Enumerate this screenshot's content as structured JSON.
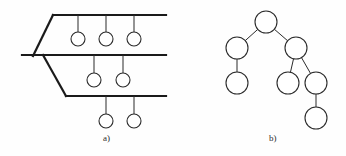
{
  "figure": {
    "width": 346,
    "height": 156,
    "background_color": "#fefefe",
    "stroke_color": "#2b2b2b",
    "thick_stroke_color": "#1a1a1a",
    "node_fill": "#ffffff",
    "panels": [
      {
        "id": "a",
        "caption": "a)",
        "caption_x": 103,
        "caption_y": 133
      },
      {
        "id": "b",
        "caption": "b)",
        "caption_x": 269,
        "caption_y": 133
      }
    ]
  },
  "panel_a": {
    "caption": "a)",
    "description": "layered horizontal bars with pendant circles",
    "bar_stroke_width": 2.2,
    "link_stroke_width": 1,
    "node_radius": 7,
    "bars": [
      {
        "name": "top-bar",
        "x1": 53,
        "y1": 15,
        "x2": 166,
        "y2": 15
      },
      {
        "name": "middle-bar",
        "x1": 22,
        "y1": 55,
        "x2": 166,
        "y2": 55
      },
      {
        "name": "bottom-bar",
        "x1": 66,
        "y1": 96,
        "x2": 166,
        "y2": 96
      }
    ],
    "diagonals": [
      {
        "name": "top-left-diagonal",
        "x1": 53,
        "y1": 15,
        "x2": 33,
        "y2": 56
      },
      {
        "name": "middle-left-diagonal",
        "x1": 43,
        "y1": 55,
        "x2": 66,
        "y2": 96
      }
    ],
    "nodes": [
      {
        "name": "node-a1",
        "cx": 78,
        "cy": 39,
        "parent_y": 15
      },
      {
        "name": "node-a2",
        "cx": 106,
        "cy": 39,
        "parent_y": 15
      },
      {
        "name": "node-a3",
        "cx": 134,
        "cy": 39,
        "parent_y": 15
      },
      {
        "name": "node-a4",
        "cx": 94,
        "cy": 80,
        "parent_y": 55
      },
      {
        "name": "node-a5",
        "cx": 123,
        "cy": 80,
        "parent_y": 55
      },
      {
        "name": "node-a6",
        "cx": 106,
        "cy": 121,
        "parent_y": 96
      },
      {
        "name": "node-a7",
        "cx": 134,
        "cy": 121,
        "parent_y": 96
      }
    ]
  },
  "panel_b": {
    "caption": "b)",
    "description": "binary tree of circular nodes",
    "link_stroke_width": 1,
    "node_stroke_width": 1.1,
    "node_radius": 11,
    "nodes": [
      {
        "name": "tree-node-root",
        "id": "n0",
        "cx": 266,
        "cy": 22
      },
      {
        "name": "tree-node-left",
        "id": "n1",
        "cx": 237,
        "cy": 48
      },
      {
        "name": "tree-node-right",
        "id": "n2",
        "cx": 296,
        "cy": 48
      },
      {
        "name": "tree-node-left-child",
        "id": "n3",
        "cx": 237,
        "cy": 83
      },
      {
        "name": "tree-node-right-left",
        "id": "n4",
        "cx": 288,
        "cy": 83
      },
      {
        "name": "tree-node-right-right",
        "id": "n5",
        "cx": 316,
        "cy": 83
      },
      {
        "name": "tree-node-deep-leaf",
        "id": "n6",
        "cx": 316,
        "cy": 118
      }
    ],
    "edges": [
      {
        "name": "edge-root-left",
        "from": "n0",
        "to": "n1"
      },
      {
        "name": "edge-root-right",
        "from": "n0",
        "to": "n2"
      },
      {
        "name": "edge-left-child",
        "from": "n1",
        "to": "n3"
      },
      {
        "name": "edge-right-left",
        "from": "n2",
        "to": "n4"
      },
      {
        "name": "edge-right-right",
        "from": "n2",
        "to": "n5"
      },
      {
        "name": "edge-right-right-leaf",
        "from": "n5",
        "to": "n6"
      }
    ]
  }
}
